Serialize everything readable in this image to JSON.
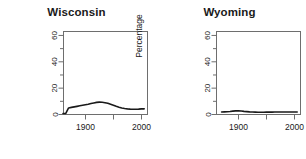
{
  "figure": {
    "panels": [
      {
        "title": "Wisconsin",
        "ylabel": "Percentage",
        "xlabel": ""
      },
      {
        "title": "Wyoming",
        "ylabel": "Percentage",
        "xlabel": ""
      }
    ],
    "y_ticks_major": [
      "0",
      "20",
      "40",
      "60"
    ],
    "y_ticks_minor": [
      10,
      30,
      50
    ],
    "x_ticks_major": [
      "1900",
      "2000"
    ],
    "x_ticks_all": [
      1900,
      1950,
      2000
    ],
    "line_color": "#1a1a1a",
    "axis_color": "#6e6e6e",
    "background": "#ffffff"
  },
  "chart_data": [
    {
      "type": "line",
      "title": "Wisconsin",
      "xlabel": "",
      "ylabel": "Percentage",
      "xlim": [
        1860,
        2010
      ],
      "ylim": [
        0,
        63
      ],
      "xticks": [
        1900,
        1950,
        2000
      ],
      "xticklabels": [
        "1900",
        "",
        "2000"
      ],
      "yticks": [
        0,
        20,
        40,
        60
      ],
      "yticklabels": [
        "0",
        "20",
        "40",
        "60"
      ],
      "grid": false,
      "legend": false,
      "x": [
        1860,
        1865,
        1870,
        1875,
        1880,
        1885,
        1890,
        1895,
        1900,
        1905,
        1910,
        1915,
        1920,
        1925,
        1930,
        1935,
        1940,
        1945,
        1950,
        1955,
        1960,
        1965,
        1970,
        1975,
        1980,
        1985,
        1990,
        1995,
        2000,
        2005
      ],
      "y": [
        0.4,
        0.5,
        4.6,
        5.0,
        5.4,
        5.8,
        6.2,
        6.6,
        7.0,
        7.4,
        7.9,
        8.4,
        8.8,
        9.0,
        8.9,
        8.6,
        8.1,
        7.4,
        6.6,
        5.8,
        5.1,
        4.6,
        4.2,
        3.9,
        3.7,
        3.6,
        3.6,
        3.7,
        3.9,
        3.9
      ]
    },
    {
      "type": "line",
      "title": "Wyoming",
      "xlabel": "",
      "ylabel": "Percentage",
      "xlim": [
        1860,
        2010
      ],
      "ylim": [
        0,
        63
      ],
      "xticks": [
        1900,
        1950,
        2000
      ],
      "xticklabels": [
        "1900",
        "",
        "2000"
      ],
      "yticks": [
        0,
        20,
        40,
        60
      ],
      "yticklabels": [
        "0",
        "20",
        "40",
        "60"
      ],
      "grid": false,
      "legend": false,
      "x": [
        1870,
        1875,
        1880,
        1885,
        1890,
        1895,
        1900,
        1905,
        1910,
        1915,
        1920,
        1925,
        1930,
        1935,
        1940,
        1945,
        1950,
        1955,
        1960,
        1965,
        1970,
        1975,
        1980,
        1985,
        1990,
        1995,
        2000,
        2005
      ],
      "y": [
        1.5,
        1.6,
        1.7,
        1.9,
        2.2,
        2.4,
        2.5,
        2.3,
        2.0,
        1.8,
        1.6,
        1.5,
        1.4,
        1.3,
        1.3,
        1.3,
        1.4,
        1.4,
        1.4,
        1.5,
        1.5,
        1.5,
        1.5,
        1.5,
        1.5,
        1.5,
        1.5,
        1.5
      ]
    }
  ]
}
